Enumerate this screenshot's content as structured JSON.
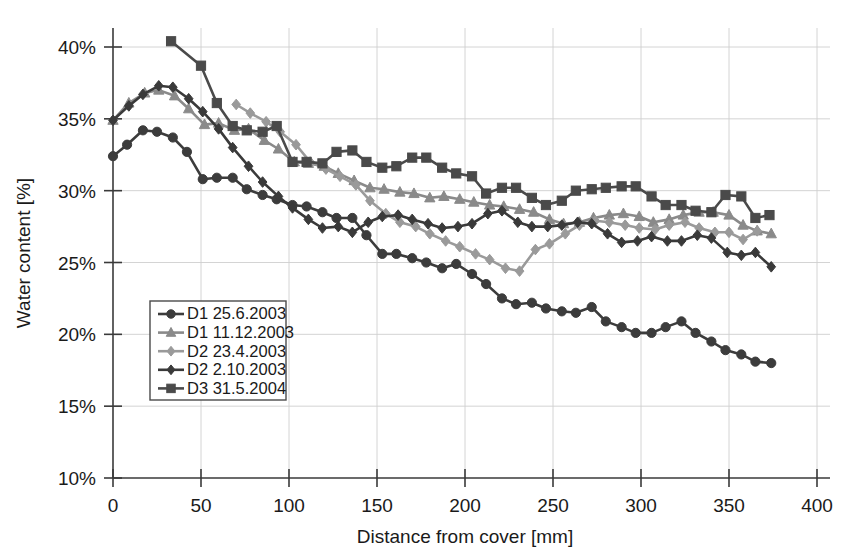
{
  "chart_data": {
    "type": "line",
    "title": "",
    "xlabel": "Distance from cover [mm]",
    "ylabel": "Water content [%]",
    "xlim": [
      0,
      400
    ],
    "ylim": [
      10,
      40
    ],
    "xticks": [
      0,
      50,
      100,
      150,
      200,
      250,
      300,
      350,
      400
    ],
    "xtick_labels": [
      "0",
      "50",
      "100",
      "150",
      "200",
      "250",
      "300",
      "350",
      "400"
    ],
    "yticks": [
      10,
      15,
      20,
      25,
      30,
      35,
      40
    ],
    "ytick_labels": [
      "10%",
      "15%",
      "20%",
      "25%",
      "30%",
      "35%",
      "40%"
    ],
    "grid": true,
    "legend_position": "lower-left-inside",
    "series": [
      {
        "name": "D1 25.6.2003",
        "marker": "circle",
        "color": "#3c3c3c",
        "points": [
          [
            0,
            32.4
          ],
          [
            8,
            33.2
          ],
          [
            17,
            34.2
          ],
          [
            25,
            34.1
          ],
          [
            34,
            33.7
          ],
          [
            42,
            32.7
          ],
          [
            51,
            30.8
          ],
          [
            59,
            30.9
          ],
          [
            68,
            30.9
          ],
          [
            76,
            30.1
          ],
          [
            85,
            29.7
          ],
          [
            93,
            29.4
          ],
          [
            102,
            29.0
          ],
          [
            110,
            28.9
          ],
          [
            119,
            28.5
          ],
          [
            127,
            28.1
          ],
          [
            136,
            28.1
          ],
          [
            144,
            26.9
          ],
          [
            153,
            25.6
          ],
          [
            161,
            25.6
          ],
          [
            170,
            25.3
          ],
          [
            178,
            25.0
          ],
          [
            187,
            24.6
          ],
          [
            195,
            24.9
          ],
          [
            204,
            24.2
          ],
          [
            212,
            23.5
          ],
          [
            221,
            22.5
          ],
          [
            229,
            22.1
          ],
          [
            238,
            22.2
          ],
          [
            246,
            21.8
          ],
          [
            255,
            21.6
          ],
          [
            263,
            21.5
          ],
          [
            272,
            21.9
          ],
          [
            280,
            20.9
          ],
          [
            289,
            20.5
          ],
          [
            297,
            20.1
          ],
          [
            306,
            20.1
          ],
          [
            314,
            20.5
          ],
          [
            323,
            20.9
          ],
          [
            331,
            20.1
          ],
          [
            340,
            19.5
          ],
          [
            348,
            18.9
          ],
          [
            357,
            18.6
          ],
          [
            365,
            18.1
          ],
          [
            374,
            18.0
          ]
        ]
      },
      {
        "name": "D1 11.12.2003",
        "marker": "triangle",
        "color": "#8a8a8a",
        "points": [
          [
            0,
            34.9
          ],
          [
            9,
            36.1
          ],
          [
            18,
            36.8
          ],
          [
            26,
            37.0
          ],
          [
            35,
            36.6
          ],
          [
            43,
            35.7
          ],
          [
            52,
            34.6
          ],
          [
            60,
            34.7
          ],
          [
            69,
            34.2
          ],
          [
            77,
            34.3
          ],
          [
            86,
            33.5
          ],
          [
            94,
            32.9
          ],
          [
            103,
            32.0
          ],
          [
            111,
            31.9
          ],
          [
            120,
            31.7
          ],
          [
            128,
            31.2
          ],
          [
            137,
            30.7
          ],
          [
            146,
            30.2
          ],
          [
            154,
            30.1
          ],
          [
            163,
            29.9
          ],
          [
            171,
            29.8
          ],
          [
            180,
            29.5
          ],
          [
            188,
            29.6
          ],
          [
            197,
            29.4
          ],
          [
            205,
            29.2
          ],
          [
            214,
            29.0
          ],
          [
            222,
            28.9
          ],
          [
            231,
            28.7
          ],
          [
            239,
            28.5
          ],
          [
            248,
            28.0
          ],
          [
            256,
            27.7
          ],
          [
            265,
            27.8
          ],
          [
            273,
            28.1
          ],
          [
            282,
            28.3
          ],
          [
            290,
            28.4
          ],
          [
            299,
            28.2
          ],
          [
            307,
            27.8
          ],
          [
            316,
            28.0
          ],
          [
            324,
            28.3
          ],
          [
            333,
            28.5
          ],
          [
            341,
            28.5
          ],
          [
            350,
            28.3
          ],
          [
            358,
            27.6
          ],
          [
            366,
            27.2
          ],
          [
            374,
            27.0
          ]
        ]
      },
      {
        "name": "D2 23.4.2003",
        "marker": "diamond",
        "color": "#9a9a9a",
        "points": [
          [
            70,
            36.0
          ],
          [
            78,
            35.4
          ],
          [
            87,
            34.8
          ],
          [
            95,
            34.1
          ],
          [
            104,
            33.2
          ],
          [
            112,
            32.0
          ],
          [
            121,
            31.5
          ],
          [
            129,
            31.0
          ],
          [
            138,
            30.4
          ],
          [
            146,
            29.3
          ],
          [
            155,
            28.4
          ],
          [
            163,
            27.8
          ],
          [
            172,
            27.5
          ],
          [
            180,
            27.0
          ],
          [
            189,
            26.5
          ],
          [
            197,
            26.1
          ],
          [
            206,
            25.6
          ],
          [
            214,
            25.2
          ],
          [
            223,
            24.6
          ],
          [
            231,
            24.4
          ],
          [
            240,
            25.9
          ],
          [
            248,
            26.3
          ],
          [
            257,
            27.0
          ],
          [
            265,
            27.6
          ],
          [
            274,
            27.9
          ],
          [
            282,
            27.8
          ],
          [
            291,
            27.6
          ],
          [
            299,
            27.4
          ],
          [
            308,
            27.3
          ],
          [
            316,
            27.6
          ],
          [
            325,
            27.8
          ],
          [
            333,
            27.4
          ],
          [
            342,
            27.1
          ],
          [
            350,
            27.1
          ],
          [
            358,
            26.6
          ],
          [
            366,
            27.2
          ]
        ]
      },
      {
        "name": "D2 2.10.2003",
        "marker": "diamond",
        "color": "#3a3a3a",
        "points": [
          [
            0,
            34.9
          ],
          [
            9,
            35.9
          ],
          [
            17,
            36.7
          ],
          [
            26,
            37.3
          ],
          [
            34,
            37.2
          ],
          [
            43,
            36.4
          ],
          [
            51,
            35.5
          ],
          [
            60,
            34.3
          ],
          [
            68,
            33.0
          ],
          [
            77,
            31.7
          ],
          [
            85,
            30.6
          ],
          [
            94,
            29.6
          ],
          [
            102,
            28.8
          ],
          [
            111,
            28.0
          ],
          [
            119,
            27.4
          ],
          [
            128,
            27.5
          ],
          [
            136,
            27.1
          ],
          [
            145,
            27.8
          ],
          [
            153,
            28.2
          ],
          [
            162,
            28.3
          ],
          [
            170,
            28.0
          ],
          [
            179,
            27.7
          ],
          [
            187,
            27.4
          ],
          [
            196,
            27.5
          ],
          [
            204,
            27.7
          ],
          [
            213,
            28.4
          ],
          [
            221,
            28.6
          ],
          [
            230,
            27.8
          ],
          [
            238,
            27.5
          ],
          [
            247,
            27.5
          ],
          [
            255,
            27.6
          ],
          [
            264,
            27.8
          ],
          [
            272,
            27.7
          ],
          [
            281,
            27.0
          ],
          [
            289,
            26.4
          ],
          [
            298,
            26.5
          ],
          [
            306,
            26.8
          ],
          [
            315,
            26.5
          ],
          [
            323,
            26.5
          ],
          [
            332,
            26.9
          ],
          [
            340,
            26.7
          ],
          [
            349,
            25.7
          ],
          [
            357,
            25.5
          ],
          [
            365,
            25.7
          ],
          [
            374,
            24.7
          ]
        ]
      },
      {
        "name": "D3 31.5.2004",
        "marker": "square",
        "color": "#4a4a4a",
        "points": [
          [
            33,
            40.4
          ],
          [
            50,
            38.7
          ],
          [
            59,
            36.1
          ],
          [
            68,
            34.5
          ],
          [
            76,
            34.2
          ],
          [
            85,
            34.1
          ],
          [
            93,
            34.5
          ],
          [
            102,
            32.0
          ],
          [
            110,
            32.0
          ],
          [
            119,
            31.9
          ],
          [
            127,
            32.7
          ],
          [
            136,
            32.8
          ],
          [
            144,
            32.0
          ],
          [
            153,
            31.6
          ],
          [
            161,
            31.7
          ],
          [
            170,
            32.3
          ],
          [
            178,
            32.3
          ],
          [
            187,
            31.6
          ],
          [
            195,
            31.2
          ],
          [
            204,
            31.0
          ],
          [
            212,
            29.8
          ],
          [
            221,
            30.2
          ],
          [
            229,
            30.2
          ],
          [
            238,
            29.5
          ],
          [
            246,
            29.0
          ],
          [
            255,
            29.3
          ],
          [
            263,
            30.0
          ],
          [
            272,
            30.1
          ],
          [
            280,
            30.2
          ],
          [
            289,
            30.3
          ],
          [
            297,
            30.3
          ],
          [
            306,
            29.6
          ],
          [
            314,
            29.0
          ],
          [
            323,
            29.0
          ],
          [
            331,
            28.6
          ],
          [
            340,
            28.5
          ],
          [
            348,
            29.7
          ],
          [
            357,
            29.6
          ],
          [
            365,
            28.1
          ],
          [
            373,
            28.3
          ]
        ]
      }
    ]
  },
  "legend": {
    "entries": [
      {
        "label": "D1 25.6.2003"
      },
      {
        "label": "D1 11.12.2003"
      },
      {
        "label": "D2 23.4.2003"
      },
      {
        "label": "D2 2.10.2003"
      },
      {
        "label": "D3 31.5.2004"
      }
    ]
  }
}
